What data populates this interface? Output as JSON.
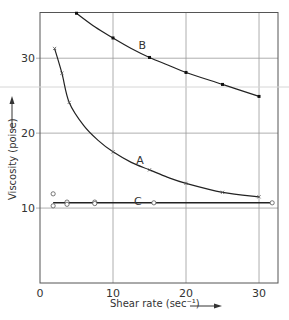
{
  "chart_data": {
    "type": "line",
    "title": "",
    "xlabel": "Shear rate (sec⁻¹)",
    "ylabel": "Viscosity (poise)",
    "xlim": [
      0,
      32.6
    ],
    "ylim": [
      0,
      36.1
    ],
    "x_ticks": [
      0,
      10,
      20,
      30
    ],
    "y_ticks": [
      10,
      20,
      30
    ],
    "x_tick_labels": [
      "0",
      "10",
      "20",
      "30"
    ],
    "y_tick_labels": [
      "10",
      "20",
      "30"
    ],
    "grid": true,
    "legend": "none (curves labelled inline A, B, C)",
    "series": [
      {
        "name": "A",
        "marker": "x",
        "points": [
          [
            2,
            31.3
          ],
          [
            3,
            28.0
          ],
          [
            4,
            24.1
          ],
          [
            10,
            17.5
          ],
          [
            15,
            15.1
          ],
          [
            20,
            13.3
          ],
          [
            25,
            12.1
          ],
          [
            30,
            11.5
          ]
        ],
        "curve": [
          [
            2,
            31.3
          ],
          [
            3,
            28.0
          ],
          [
            4,
            24.1
          ],
          [
            6,
            21.0
          ],
          [
            8,
            19.0
          ],
          [
            10,
            17.5
          ],
          [
            12.5,
            16.1
          ],
          [
            15,
            15.1
          ],
          [
            17.5,
            14.1
          ],
          [
            20,
            13.3
          ],
          [
            25,
            12.1
          ],
          [
            30,
            11.5
          ]
        ],
        "label_pos": [
          13.7,
          16.4
        ]
      },
      {
        "name": "B",
        "marker": "filled-dot",
        "points": [
          [
            5,
            36.0
          ],
          [
            10,
            32.7
          ],
          [
            15,
            30.1
          ],
          [
            20,
            28.1
          ],
          [
            25,
            26.5
          ],
          [
            30,
            24.9
          ]
        ],
        "curve": [
          [
            5,
            36.0
          ],
          [
            7.5,
            34.2
          ],
          [
            10,
            32.7
          ],
          [
            12.5,
            31.3
          ],
          [
            15,
            30.1
          ],
          [
            17.5,
            29.1
          ],
          [
            20,
            28.1
          ],
          [
            25,
            26.5
          ],
          [
            30,
            24.9
          ]
        ],
        "label_pos": [
          14.0,
          31.7
        ]
      },
      {
        "name": "C",
        "marker": "open-circle",
        "points": [
          [
            1.8,
            11.9
          ],
          [
            1.8,
            10.3
          ],
          [
            3.7,
            10.8
          ],
          [
            3.7,
            10.5
          ],
          [
            7.5,
            10.8
          ],
          [
            7.5,
            10.6
          ],
          [
            15.6,
            10.7
          ],
          [
            31.8,
            10.7
          ]
        ],
        "curve": [
          [
            1.8,
            10.7
          ],
          [
            31.8,
            10.7
          ]
        ],
        "label_pos": [
          13.4,
          11.0
        ]
      }
    ]
  }
}
